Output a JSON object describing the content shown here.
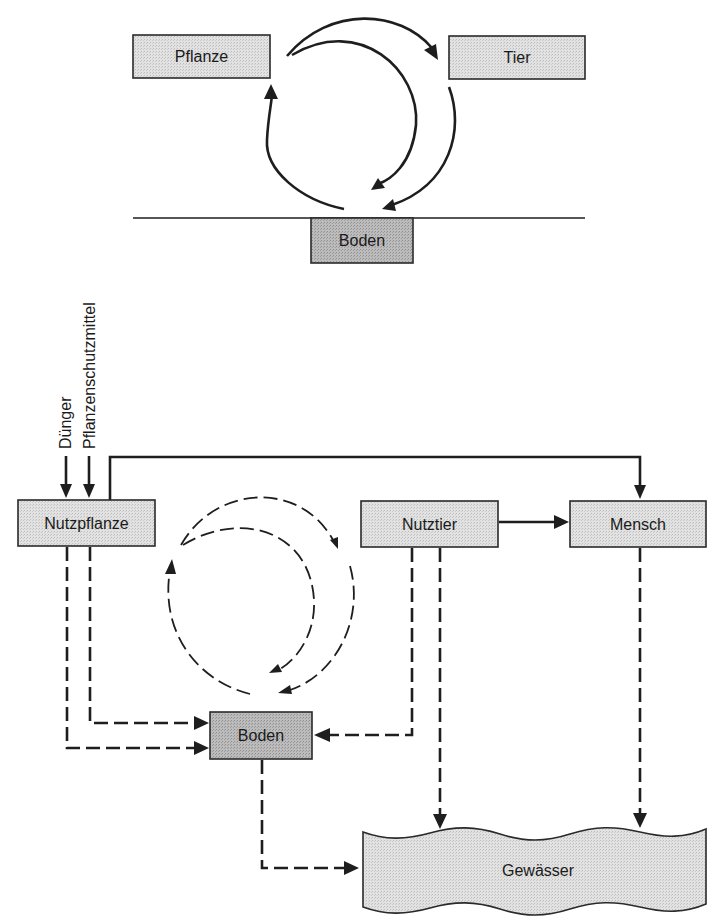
{
  "top_cycle": {
    "nodes": {
      "plant": "Pflanze",
      "animal": "Tier",
      "soil": "Boden"
    }
  },
  "bottom_system": {
    "inputs": {
      "fertilizer": "Dünger",
      "pesticide": "Pflanzenschutzmittel"
    },
    "nodes": {
      "crop": "Nutzpflanze",
      "livestock": "Nutztier",
      "human": "Mensch",
      "soil": "Boden",
      "water": "Gewässer"
    }
  },
  "colors": {
    "box_light": "#d9d9d9",
    "box_dark": "#b3b3b3",
    "line": "#1e1e1e"
  }
}
